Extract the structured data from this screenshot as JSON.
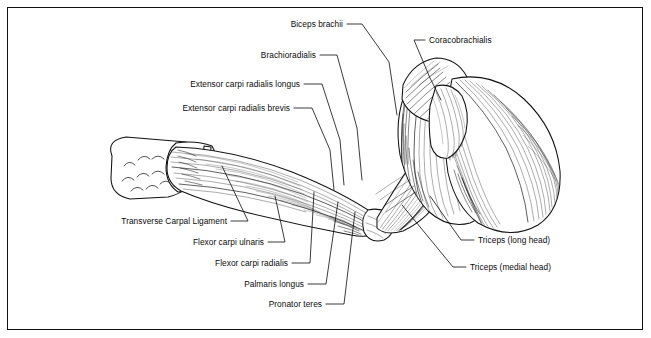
{
  "figure": {
    "view": "lateral-flexed-arm",
    "background_color": "#ffffff",
    "line_color": "#111111",
    "border_color": "#111111"
  },
  "labels": [
    {
      "id": "biceps-brachii",
      "text": "Biceps brachii",
      "side": "left",
      "text_x": 343,
      "text_y": 27,
      "leader": "M347,24 L362,24 L389,62 L397,115"
    },
    {
      "id": "brachioradialis",
      "text": "Brachioradialis",
      "side": "left",
      "text_x": 316,
      "text_y": 58,
      "leader": "M320,55 L337,55 L357,128 L362,180"
    },
    {
      "id": "extensor-carpi-radialis-longus",
      "text": "Extensor carpi radialis longus",
      "side": "left",
      "text_x": 300,
      "text_y": 87,
      "leader": "M304,84 L322,84 L340,140 L344,185"
    },
    {
      "id": "extensor-carpi-radialis-brevis",
      "text": "Extensor carpi radialis brevis",
      "side": "left",
      "text_x": 290,
      "text_y": 111,
      "leader": "M294,108 L312,108 L330,150 L334,190"
    },
    {
      "id": "coracobrachialis",
      "text": "Coracobrachialis",
      "side": "right",
      "text_x": 429,
      "text_y": 43,
      "leader": "M425,40 L414,40 L430,78 L441,100"
    },
    {
      "id": "triceps-long-head",
      "text": "Triceps (long head)",
      "side": "right",
      "text_x": 478,
      "text_y": 243,
      "leader": "M474,240 L461,240 L430,196"
    },
    {
      "id": "triceps-medial-head",
      "text": "Triceps (medial head)",
      "side": "right",
      "text_x": 470,
      "text_y": 270,
      "leader": "M466,267 L453,267 L402,205"
    },
    {
      "id": "transverse-carpal-ligament",
      "text": "Transverse Carpal Ligament",
      "side": "left",
      "text_x": 227,
      "text_y": 224,
      "leader": "M231,221 L248,221 L222,166"
    },
    {
      "id": "flexor-carpi-ulnaris",
      "text": "Flexor carpi ulnaris",
      "side": "left",
      "text_x": 264,
      "text_y": 245,
      "leader": "M268,242 L285,242 L275,196"
    },
    {
      "id": "flexor-carpi-radialis",
      "text": "Flexor carpi radialis",
      "side": "left",
      "text_x": 288,
      "text_y": 266,
      "leader": "M292,263 L310,263 L314,192"
    },
    {
      "id": "palmaris-longus",
      "text": "Palmaris longus",
      "side": "left",
      "text_x": 304,
      "text_y": 287,
      "leader": "M308,284 L326,284 L338,202"
    },
    {
      "id": "pronator-teres",
      "text": "Pronator teres",
      "side": "left",
      "text_x": 322,
      "text_y": 307,
      "leader": "M326,304 L344,304 L355,212"
    }
  ]
}
